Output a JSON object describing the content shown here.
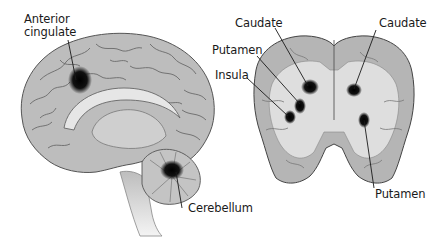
{
  "figure": {
    "panels": [
      {
        "name": "sagittal-view",
        "labels": {
          "anterior_cingulate_line1": "Anterior",
          "anterior_cingulate_line2": "cingulate",
          "cerebellum": "Cerebellum"
        }
      },
      {
        "name": "coronal-view",
        "labels": {
          "caudate_left": "Caudate",
          "caudate_right": "Caudate",
          "putamen_left": "Putamen",
          "putamen_right": "Putamen",
          "insula": "Insula"
        }
      }
    ],
    "colors": {
      "brain_tissue": "#b8b8b8",
      "white_matter": "#e2e2e2",
      "activation": "#0a0a0a",
      "outline": "#3a3a3a",
      "label_text": "#1a1a1a"
    }
  }
}
